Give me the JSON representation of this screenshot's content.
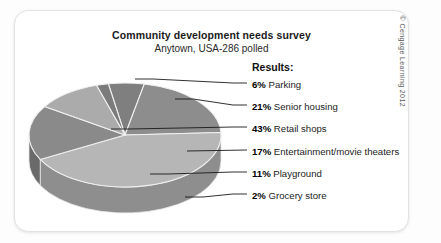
{
  "card": {
    "title": "Community development needs survey",
    "subtitle": "Anytown, USA-286 polled",
    "copyright": "© Cengage Learning 2012"
  },
  "results": {
    "heading": "Results:"
  },
  "chart_data": {
    "type": "pie",
    "title": "Community development needs survey",
    "subtitle": "Anytown, USA-286 polled",
    "legend_position": "right",
    "three_d": true,
    "total_polled": 286,
    "categories": [
      "Parking",
      "Senior housing",
      "Retail shops",
      "Entertainment/movie theaters",
      "Playground",
      "Grocery store"
    ],
    "values": [
      6,
      21,
      43,
      17,
      11,
      2
    ],
    "value_unit": "%",
    "slices": [
      {
        "label": "Parking",
        "pct": 6,
        "pct_text": "6%",
        "color": "#7f7f7f",
        "side_color": "#5f5f5f"
      },
      {
        "label": "Senior housing",
        "pct": 21,
        "pct_text": "21%",
        "color": "#8d8d8d",
        "side_color": "#6b6b6b"
      },
      {
        "label": "Retail shops",
        "pct": 43,
        "pct_text": "43%",
        "color": "#b6b6b6",
        "side_color": "#8e8e8e"
      },
      {
        "label": "Entertainment/movie theaters",
        "pct": 17,
        "pct_text": "17%",
        "color": "#8a8a8a",
        "side_color": "#6a6a6a"
      },
      {
        "label": "Playground",
        "pct": 11,
        "pct_text": "11%",
        "color": "#ababab",
        "side_color": "#858585"
      },
      {
        "label": "Grocery store",
        "pct": 2,
        "pct_text": "2%",
        "color": "#7b7b7b",
        "side_color": "#5c5c5c"
      }
    ]
  }
}
